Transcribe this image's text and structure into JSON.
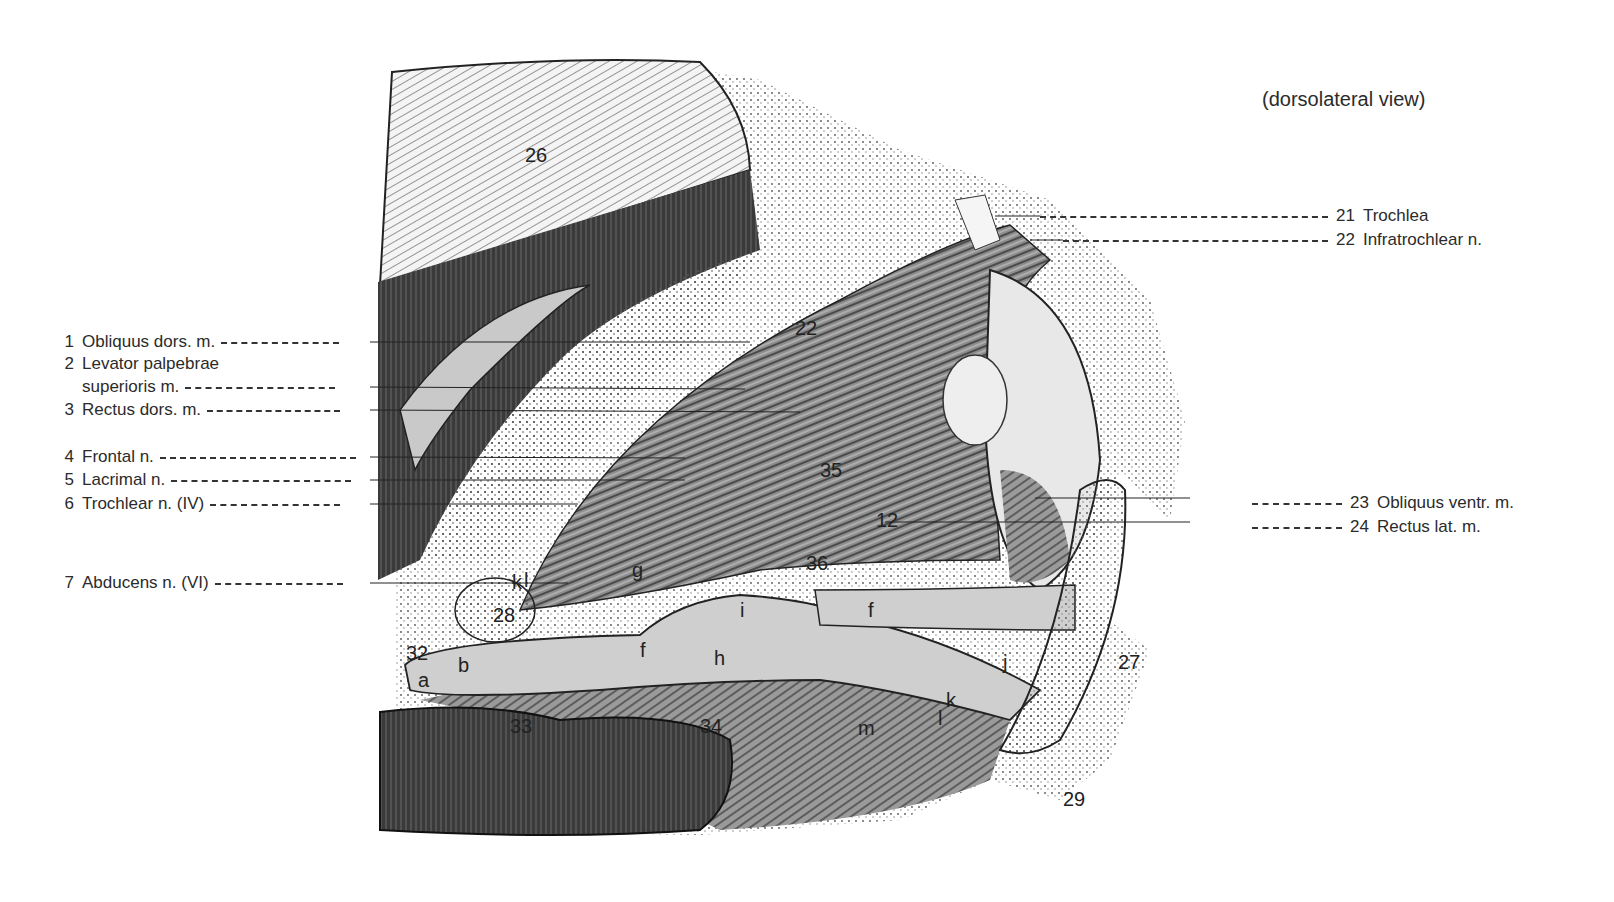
{
  "figure": {
    "caption": "(dorsolateral view)",
    "left_labels": [
      {
        "num": "1",
        "text": "Obliquus dors. m.",
        "top": 332,
        "dash": 118
      },
      {
        "num": "2",
        "text": "Levator palpebrae",
        "top": 354,
        "dash": 0
      },
      {
        "num": "",
        "text": "superioris m.",
        "top": 377,
        "dash": 150
      },
      {
        "num": "3",
        "text": "Rectus dors. m.",
        "top": 400,
        "dash": 133
      },
      {
        "num": "4",
        "text": "Frontal n.",
        "top": 447,
        "dash": 196
      },
      {
        "num": "5",
        "text": "Lacrimal n.",
        "top": 470,
        "dash": 180
      },
      {
        "num": "6",
        "text": "Trochlear n. (IV)",
        "top": 494,
        "dash": 130
      },
      {
        "num": "7",
        "text": "Abducens n. (VI)",
        "top": 573,
        "dash": 128
      }
    ],
    "right_labels": [
      {
        "num": "21",
        "text": "Trochlea",
        "top": 206,
        "left": 1040,
        "dash": 288
      },
      {
        "num": "22",
        "text": "Infratrochlear n.",
        "top": 230,
        "left": 1063,
        "dash": 265
      },
      {
        "num": "23",
        "text": "Obliquus ventr. m.",
        "top": 493,
        "left": 1252,
        "dash": 90
      },
      {
        "num": "24",
        "text": "Rectus lat. m.",
        "top": 517,
        "left": 1252,
        "dash": 90
      }
    ],
    "inline_labels": [
      {
        "text": "26",
        "x": 525,
        "y": 145
      },
      {
        "text": "22",
        "x": 795,
        "y": 318
      },
      {
        "text": "35",
        "x": 820,
        "y": 460
      },
      {
        "text": "12",
        "x": 876,
        "y": 510
      },
      {
        "text": "36",
        "x": 806,
        "y": 553
      },
      {
        "text": "g",
        "x": 632,
        "y": 560
      },
      {
        "text": "k",
        "x": 512,
        "y": 572
      },
      {
        "text": "l",
        "x": 524,
        "y": 570
      },
      {
        "text": "28",
        "x": 493,
        "y": 605
      },
      {
        "text": "i",
        "x": 740,
        "y": 600
      },
      {
        "text": "f",
        "x": 868,
        "y": 600
      },
      {
        "text": "32",
        "x": 406,
        "y": 643
      },
      {
        "text": "f",
        "x": 640,
        "y": 640
      },
      {
        "text": "b",
        "x": 458,
        "y": 655
      },
      {
        "text": "h",
        "x": 714,
        "y": 648
      },
      {
        "text": "a",
        "x": 418,
        "y": 670
      },
      {
        "text": "j",
        "x": 1003,
        "y": 652
      },
      {
        "text": "27",
        "x": 1118,
        "y": 652
      },
      {
        "text": "k",
        "x": 946,
        "y": 690
      },
      {
        "text": "l",
        "x": 938,
        "y": 708
      },
      {
        "text": "33",
        "x": 510,
        "y": 716
      },
      {
        "text": "34",
        "x": 700,
        "y": 716
      },
      {
        "text": "m",
        "x": 858,
        "y": 718
      },
      {
        "text": "29",
        "x": 1063,
        "y": 789
      }
    ]
  }
}
